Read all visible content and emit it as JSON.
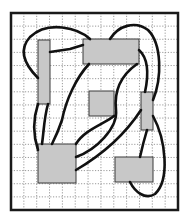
{
  "diagram": {
    "type": "placement-routing-grid",
    "frame": {
      "x": 11,
      "y": 13,
      "w": 167,
      "h": 197,
      "stroke": "#1a1a1a",
      "stroke_width": 2.5
    },
    "grid": {
      "spacing": 12.8,
      "color": "#9a9a9a",
      "dash": "1.2 1.6",
      "cols": 13,
      "rows": 15
    },
    "block_fill": "#c8c8c8",
    "block_stroke": "#3a3a3a",
    "wire_color": "#111111",
    "wire_width": 2.6,
    "blocks": [
      {
        "id": "A",
        "x": 38,
        "y": 40,
        "w": 12,
        "h": 64
      },
      {
        "id": "B",
        "x": 83,
        "y": 39,
        "w": 56,
        "h": 25
      },
      {
        "id": "C",
        "x": 89,
        "y": 91,
        "w": 25,
        "h": 25
      },
      {
        "id": "D",
        "x": 141,
        "y": 92,
        "w": 12,
        "h": 38
      },
      {
        "id": "E",
        "x": 38,
        "y": 144,
        "w": 38,
        "h": 39
      },
      {
        "id": "F",
        "x": 115,
        "y": 157,
        "w": 38,
        "h": 25
      }
    ],
    "wires": [
      {
        "from": "A",
        "to": "B",
        "d": "M50 52 L70 49 L83 45"
      },
      {
        "from": "A",
        "to": "B",
        "d": "M38 78 C22 62 20 48 30 37 C48 20 78 28 90 39"
      },
      {
        "from": "B",
        "to": "D",
        "d": "M110 39 C118 26 135 20 148 30 C162 44 162 78 153 100"
      },
      {
        "from": "B",
        "to": "E",
        "d": "M89 64 C76 78 66 100 62 120 C58 132 54 140 52 144"
      },
      {
        "from": "B",
        "to": "D",
        "d": "M139 50 C150 60 148 78 145 92"
      },
      {
        "from": "A",
        "to": "E",
        "d": "M38 104 C34 116 32 132 38 150"
      },
      {
        "from": "A",
        "to": "E",
        "d": "M48 104 C44 118 44 130 42 144"
      },
      {
        "from": "C",
        "to": "E",
        "d": "M114 116 C104 124 84 130 76 144"
      },
      {
        "from": "B",
        "to": "E",
        "d": "M137 64 C120 76 114 92 116 110 C118 128 96 150 76 157"
      },
      {
        "from": "D",
        "to": "E",
        "d": "M141 110 C128 130 110 150 76 170"
      },
      {
        "from": "D",
        "to": "F",
        "d": "M147 130 C144 140 142 148 140 157"
      },
      {
        "from": "D",
        "to": "F",
        "d": "M153 116 C166 140 170 180 155 194 C145 200 135 192 130 182"
      }
    ]
  }
}
